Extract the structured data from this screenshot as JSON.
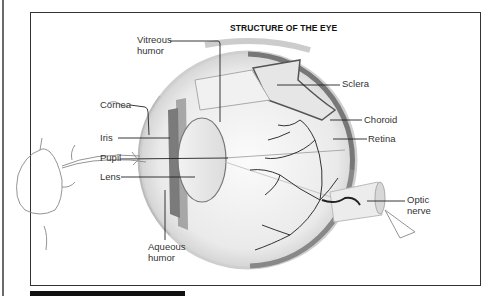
{
  "diagram": {
    "title": "STRUCTURE OF THE EYE",
    "labels": {
      "vitreous_humor_1": "Vitreous",
      "vitreous_humor_2": "humor",
      "sclera": "Sclera",
      "cornea": "Cornea",
      "choroid": "Choroid",
      "iris": "Iris",
      "retina": "Retina",
      "pupil": "Pupil",
      "lens": "Lens",
      "optic_nerve_1": "Optic",
      "optic_nerve_2": "nerve",
      "aqueous_humor_1": "Aqueous",
      "aqueous_humor_2": "humor"
    }
  },
  "colors": {
    "frame": "#333333",
    "label_text": "#333333",
    "sketch": "#888888",
    "bar": "#111111"
  }
}
